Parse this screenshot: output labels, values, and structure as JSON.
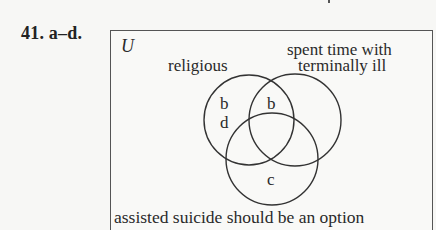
{
  "problem": {
    "number_label": "41. a–d."
  },
  "venn": {
    "universe_label": "U",
    "sets": [
      {
        "id": "A",
        "label": "religious"
      },
      {
        "id": "B",
        "label_line1": "spent time with",
        "label_line2": "terminally ill"
      },
      {
        "id": "C",
        "label": "assisted suicide should be an option"
      }
    ],
    "regions": {
      "A_only_1": "b",
      "A_only_2": "d",
      "A_and_B_only": "b",
      "C_only": "c"
    }
  }
}
